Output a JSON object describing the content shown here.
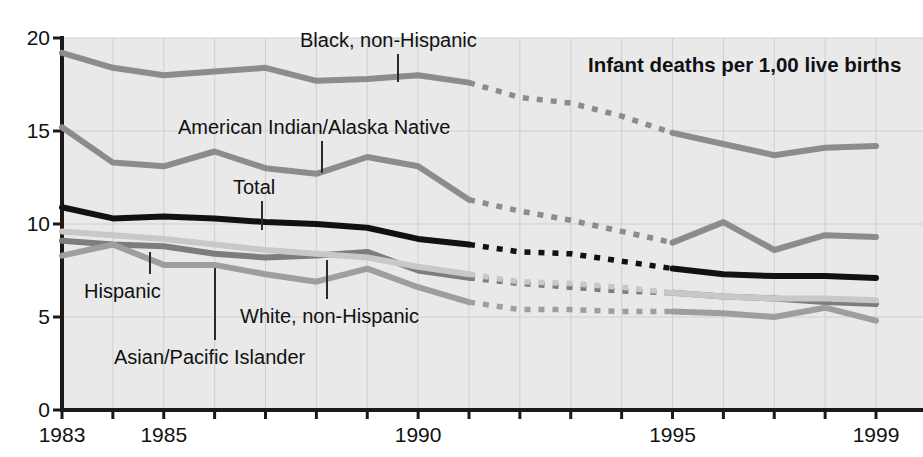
{
  "chart_data": {
    "type": "line",
    "title": "Infant deaths per 1,00 live births",
    "xlabel": "",
    "ylabel": "",
    "xlim": [
      1983,
      1999
    ],
    "ylim": [
      0,
      20
    ],
    "grid": true,
    "legend_position": "inline-annotations",
    "x": [
      1983,
      1984,
      1985,
      1986,
      1987,
      1988,
      1989,
      1990,
      1991,
      1992,
      1993,
      1994,
      1995,
      1996,
      1997,
      1998,
      1999
    ],
    "yticks": [
      "0",
      "5",
      "10",
      "15",
      "20"
    ],
    "ytick_values": [
      0,
      5,
      10,
      15,
      20
    ],
    "xticks": [
      "1983",
      "1985",
      "1990",
      "1995",
      "1999"
    ],
    "xtick_values": [
      1983,
      1985,
      1990,
      1995,
      1999
    ],
    "dashed_range": [
      1991,
      1995
    ],
    "series": [
      {
        "name": "Black, non-Hispanic",
        "color": "#8c8c8c",
        "width": 6,
        "values": [
          19.2,
          18.4,
          18.0,
          18.2,
          18.4,
          17.7,
          17.8,
          18.0,
          17.6,
          16.8,
          16.5,
          15.8,
          14.9,
          14.3,
          13.7,
          14.1,
          14.2
        ]
      },
      {
        "name": "American Indian/Alaska Native",
        "color": "#8c8c8c",
        "width": 6,
        "values": [
          15.2,
          13.3,
          13.1,
          13.9,
          13.0,
          12.7,
          13.6,
          13.1,
          11.3,
          10.7,
          10.2,
          9.6,
          9.0,
          10.1,
          8.6,
          9.4,
          9.3
        ]
      },
      {
        "name": "Total",
        "color": "#111111",
        "width": 6,
        "values": [
          10.9,
          10.3,
          10.4,
          10.3,
          10.1,
          10.0,
          9.8,
          9.2,
          8.9,
          8.5,
          8.4,
          8.0,
          7.6,
          7.3,
          7.2,
          7.2,
          7.1
        ]
      },
      {
        "name": "Hispanic",
        "color": "#7d7d7d",
        "width": 6,
        "values": [
          9.1,
          8.9,
          8.8,
          8.4,
          8.2,
          8.3,
          8.5,
          7.5,
          7.1,
          6.8,
          6.6,
          6.4,
          6.3,
          6.1,
          6.0,
          5.8,
          5.7
        ]
      },
      {
        "name": "White, non-Hispanic",
        "color": "#c8c8c8",
        "width": 6,
        "values": [
          9.6,
          9.4,
          9.2,
          8.9,
          8.6,
          8.4,
          8.2,
          7.7,
          7.3,
          6.9,
          6.8,
          6.6,
          6.3,
          6.1,
          6.0,
          6.0,
          5.9
        ]
      },
      {
        "name": "Asian/Pacific Islander",
        "color": "#9e9e9e",
        "width": 6,
        "values": [
          8.3,
          8.9,
          7.8,
          7.8,
          7.3,
          6.9,
          7.6,
          6.6,
          5.8,
          5.4,
          5.4,
          5.3,
          5.3,
          5.2,
          5.0,
          5.5,
          4.8
        ]
      }
    ],
    "annotations": [
      {
        "name": "black-non-hispanic",
        "label": "Black, non-Hispanic",
        "x": 300,
        "y": 30,
        "leader_x": 398,
        "leader_y0": 54,
        "leader_y1": 82
      },
      {
        "name": "american-indian-alaska-native",
        "label": "American Indian/Alaska Native",
        "x": 178,
        "y": 117,
        "leader_x": 322,
        "leader_y0": 141,
        "leader_y1": 173
      },
      {
        "name": "total",
        "label": "Total",
        "x": 233,
        "y": 177,
        "leader_x": 262,
        "leader_y0": 201,
        "leader_y1": 230
      },
      {
        "name": "hispanic",
        "label": "Hispanic",
        "x": 84,
        "y": 281,
        "leader_x": 150,
        "leader_y0": 252,
        "leader_y1": 274
      },
      {
        "name": "white-non-hispanic",
        "label": "White, non-Hispanic",
        "x": 240,
        "y": 306,
        "leader_x": 327,
        "leader_y0": 260,
        "leader_y1": 299
      },
      {
        "name": "asian-pacific-islander",
        "label": "Asian/Pacific Islander",
        "x": 114,
        "y": 347,
        "leader_x": 215,
        "leader_y0": 268,
        "leader_y1": 340
      },
      {
        "name": "chart-title",
        "label": "Infant deaths per 1,00 live births",
        "x": 588,
        "y": 54,
        "leader_x": null,
        "leader_y0": null,
        "leader_y1": null
      }
    ]
  }
}
